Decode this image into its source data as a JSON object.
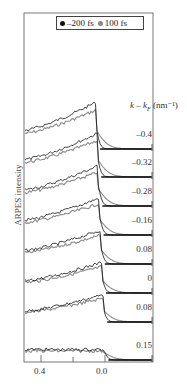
{
  "chart_data": {
    "type": "line",
    "title": "",
    "xlabel": "",
    "ylabel": "ARPES intensity",
    "x_axis": {
      "ticks": [
        "0.4",
        "0.0"
      ],
      "reversed": true,
      "range": [
        0.55,
        -0.25
      ]
    },
    "legend": {
      "position": "top",
      "entries": [
        {
          "name": "–200 fs",
          "color": "#111111"
        },
        {
          "name": "100 fs",
          "color": "#808080"
        }
      ]
    },
    "right_axis_label": "k – k_F (nm⁻¹)",
    "grid": false,
    "offset_series": true,
    "traces": [
      {
        "k": "-0.4"
      },
      {
        "k": "-0.32"
      },
      {
        "k": "-0.28"
      },
      {
        "k": "-0.16"
      },
      {
        "k": "0.08"
      },
      {
        "k": "0"
      },
      {
        "k": "0.08"
      },
      {
        "k": "0.15"
      }
    ]
  },
  "labels": {
    "ylabel": "ARPES intensity",
    "legend_a": "–200 fs",
    "legend_b": "100 fs",
    "k_axis": "k – k",
    "k_sub": "F",
    "k_unit": " (nm⁻¹)",
    "x_tick_1": "0.4",
    "x_tick_2": "0.0",
    "k_values": [
      "–0.4",
      "–0.32",
      "–0.28",
      "–0.16",
      "0.08",
      "0",
      "0.08",
      "0.15"
    ]
  }
}
